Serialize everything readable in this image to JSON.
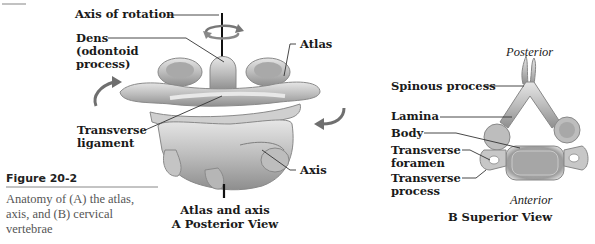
{
  "figure": {
    "number": "Figure 20-2",
    "caption": "Anatomy of (A) the atlas, axis, and (B) cervical vertebrae",
    "caption_lines": [
      "Anatomy of (A) the atlas,",
      "axis, and (B) cervical",
      "vertebrae"
    ]
  },
  "panel_a": {
    "title_line1": "Atlas and axis",
    "title_line2": "A  Posterior View",
    "labels": {
      "axis_of_rotation": "Axis of rotation",
      "dens_line1": "Dens",
      "dens_line2": "(odontoid",
      "dens_line3": "process)",
      "atlas": "Atlas",
      "transverse_ligament_line1": "Transverse",
      "transverse_ligament_line2": "ligament",
      "axis": "Axis"
    }
  },
  "panel_b": {
    "title": "B  Superior View",
    "orientation_top": "Posterior",
    "orientation_bottom": "Anterior",
    "labels": {
      "spinous_process": "Spinous process",
      "lamina": "Lamina",
      "body": "Body",
      "transverse_foramen_line1": "Transverse",
      "transverse_foramen_line2": "foramen",
      "transverse_process_line1": "Transverse",
      "transverse_process_line2": "process"
    }
  },
  "colors": {
    "bone_light": "#d9d9d9",
    "bone_mid": "#b8b8b8",
    "bone_dark": "#7a7a7a",
    "leader_line": "#333333",
    "arrow": "#6f6f6f",
    "caption_rule": "#888888"
  }
}
